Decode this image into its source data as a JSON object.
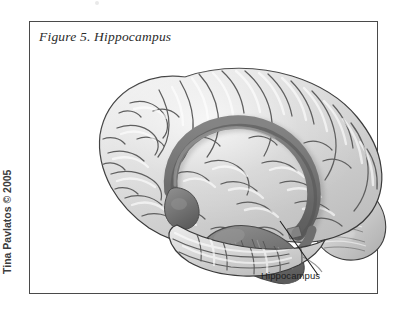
{
  "figure": {
    "title": "Figure 5. Hippocampus",
    "credit": "Tina Pavlatos © 2005",
    "frame_color": "#4a4a4a",
    "background_color": "#ffffff"
  },
  "illustration": {
    "subject": "human brain lateral view",
    "type": "anatomical line-and-tone drawing",
    "cortex_color": "#d6d6d6",
    "sulci_color": "#6f6f6f",
    "highlight_color": "#7b7b7b",
    "highlight_shadow_color": "#5e5e5e",
    "outline_color": "#3a3a3a",
    "signature_mark": "artist signature (illegible)",
    "structures": [
      {
        "name": "cerebral-cortex",
        "label": ""
      },
      {
        "name": "fornix-arch",
        "label": ""
      },
      {
        "name": "hippocampus-body",
        "label": ""
      },
      {
        "name": "cerebellum",
        "label": ""
      },
      {
        "name": "temporal-lobe",
        "label": ""
      },
      {
        "name": "brainstem",
        "label": ""
      }
    ]
  },
  "annotations": [
    {
      "id": "hippocampus",
      "label": "Hippocampus",
      "leader_from": {
        "x": 250,
        "y": 178
      },
      "leader_to": {
        "x": 268,
        "y": 226
      }
    }
  ]
}
